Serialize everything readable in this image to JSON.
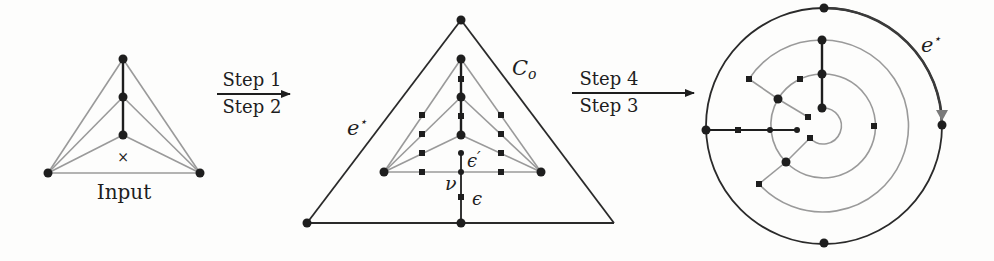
{
  "colors": {
    "ink": "#1e1e1e",
    "gray_edge": "#9a9a9a",
    "background": "#fdfdfc",
    "arrowhead_gray": "#7a7a7a"
  },
  "panels": {
    "input": {
      "caption": "Input",
      "face_marker": "×"
    },
    "arrow1": {
      "top_label": "Step 1",
      "bottom_label": "Step 2"
    },
    "middle": {
      "outer_cycle_label": "C",
      "outer_cycle_sub": "o",
      "outer_edge_label": "e",
      "outer_edge_sup": "⋆",
      "vertex_label": "ν",
      "edge_label_upper": "ϵ",
      "edge_label_upper_prime": "′",
      "edge_label_lower": "ϵ"
    },
    "arrow2": {
      "top_label": "Step 4",
      "bottom_label": "Step 3"
    },
    "circular": {
      "edge_label": "e",
      "edge_sup": "⋆"
    }
  },
  "legend_icons": {
    "vertex": "filled-circle",
    "subdivision_vertex": "filled-square"
  }
}
